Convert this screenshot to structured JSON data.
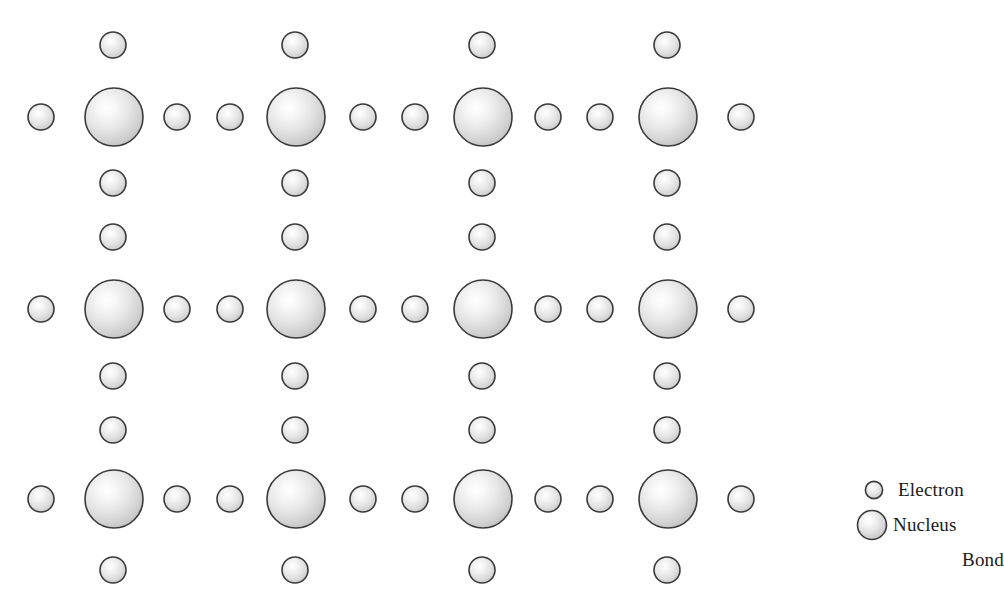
{
  "figure": {
    "type": "crystal-lattice-diagram",
    "background_color": "#ffffff",
    "width": 1004,
    "height": 614
  },
  "style": {
    "sphere_outline_color": "#3a3a3a",
    "sphere_fill_light": "#fdfdfd",
    "sphere_fill_mid": "#e2e2e2",
    "sphere_fill_dark": "#bcbcbc",
    "nucleus_radius": 29,
    "electron_radius": 13,
    "outline_width": 1.6,
    "highlight_offset_x": "38%",
    "highlight_offset_y": "34%"
  },
  "lattice": {
    "nucleus_columns_x": [
      114,
      296,
      483,
      668
    ],
    "nucleus_rows_y": [
      117,
      309,
      499
    ],
    "electron_column_x": [
      41,
      177,
      230,
      363,
      415,
      548,
      600,
      741
    ],
    "nuclei": [
      {
        "cx": 114,
        "cy": 117
      },
      {
        "cx": 296,
        "cy": 117
      },
      {
        "cx": 483,
        "cy": 117
      },
      {
        "cx": 668,
        "cy": 117
      },
      {
        "cx": 114,
        "cy": 309
      },
      {
        "cx": 296,
        "cy": 309
      },
      {
        "cx": 483,
        "cy": 309
      },
      {
        "cx": 668,
        "cy": 309
      },
      {
        "cx": 114,
        "cy": 499
      },
      {
        "cx": 296,
        "cy": 499
      },
      {
        "cx": 483,
        "cy": 499
      },
      {
        "cx": 668,
        "cy": 499
      }
    ],
    "electrons": [
      {
        "cx": 113,
        "cy": 45
      },
      {
        "cx": 295,
        "cy": 45
      },
      {
        "cx": 482,
        "cy": 45
      },
      {
        "cx": 667,
        "cy": 45
      },
      {
        "cx": 41,
        "cy": 117
      },
      {
        "cx": 177,
        "cy": 117
      },
      {
        "cx": 230,
        "cy": 117
      },
      {
        "cx": 363,
        "cy": 117
      },
      {
        "cx": 415,
        "cy": 117
      },
      {
        "cx": 548,
        "cy": 117
      },
      {
        "cx": 600,
        "cy": 117
      },
      {
        "cx": 741,
        "cy": 117
      },
      {
        "cx": 113,
        "cy": 183
      },
      {
        "cx": 295,
        "cy": 183
      },
      {
        "cx": 482,
        "cy": 183
      },
      {
        "cx": 667,
        "cy": 183
      },
      {
        "cx": 113,
        "cy": 237
      },
      {
        "cx": 295,
        "cy": 237
      },
      {
        "cx": 482,
        "cy": 237
      },
      {
        "cx": 667,
        "cy": 237
      },
      {
        "cx": 41,
        "cy": 309
      },
      {
        "cx": 177,
        "cy": 309
      },
      {
        "cx": 230,
        "cy": 309
      },
      {
        "cx": 363,
        "cy": 309
      },
      {
        "cx": 415,
        "cy": 309
      },
      {
        "cx": 548,
        "cy": 309
      },
      {
        "cx": 600,
        "cy": 309
      },
      {
        "cx": 741,
        "cy": 309
      },
      {
        "cx": 113,
        "cy": 376
      },
      {
        "cx": 295,
        "cy": 376
      },
      {
        "cx": 482,
        "cy": 376
      },
      {
        "cx": 667,
        "cy": 376
      },
      {
        "cx": 113,
        "cy": 430
      },
      {
        "cx": 295,
        "cy": 430
      },
      {
        "cx": 482,
        "cy": 430
      },
      {
        "cx": 667,
        "cy": 430
      },
      {
        "cx": 41,
        "cy": 499
      },
      {
        "cx": 177,
        "cy": 499
      },
      {
        "cx": 230,
        "cy": 499
      },
      {
        "cx": 363,
        "cy": 499
      },
      {
        "cx": 415,
        "cy": 499
      },
      {
        "cx": 548,
        "cy": 499
      },
      {
        "cx": 600,
        "cy": 499
      },
      {
        "cx": 741,
        "cy": 499
      },
      {
        "cx": 113,
        "cy": 570
      },
      {
        "cx": 295,
        "cy": 570
      },
      {
        "cx": 482,
        "cy": 570
      },
      {
        "cx": 667,
        "cy": 570
      }
    ]
  },
  "legend": {
    "electron": {
      "label": "Electron",
      "marker": "small-sphere",
      "marker_radius": 9
    },
    "nucleus": {
      "label": "Nucleus",
      "marker": "large-sphere",
      "marker_radius": 15
    },
    "bond": {
      "label": "Bond",
      "marker": "none"
    }
  }
}
